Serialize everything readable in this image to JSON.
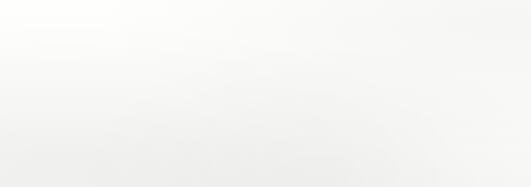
{
  "chart_data": {
    "type": "bar",
    "orientation": "horizontal",
    "title": "",
    "subtitle": "",
    "xlabel": "",
    "ylabel": "",
    "grid": false,
    "legend": null,
    "axis_line": "left vertical category axis",
    "xlim": [
      0,
      70
    ],
    "categories": [
      "1960",
      "1965",
      "1970",
      "1975",
      "1980",
      "1985",
      "1990",
      "1996"
    ],
    "values": [
      19,
      29,
      30,
      37,
      45,
      53,
      59,
      63
    ],
    "value_labels": [
      "19%",
      "29%",
      "30%",
      "37%",
      "45%",
      "53%",
      "59%",
      "63%"
    ],
    "tick_labels": [
      "1960",
      "1965",
      "1970",
      "1975",
      "1980",
      "1985",
      "1990",
      "1996"
    ],
    "annotations": [],
    "bar_colors": [
      "#575757",
      "#a9a9a9",
      "#575757",
      "#a9a9a9",
      "#575757",
      "#a9a9a9",
      "#575757",
      "#a9a9a9"
    ],
    "colors": {
      "bar_dark": "#575757",
      "bar_light": "#a9a9a9",
      "bar_dark_border": "#3e3e3e",
      "bar_light_border": "#7f7f7f",
      "axis": "#8d8d8d",
      "label_text": "#2a2a2a",
      "value_text": "#1b1b1b",
      "background": "#fdfdfc"
    },
    "bars": [
      {
        "category": "1960",
        "value": 19,
        "label": "19%",
        "shade": "dark",
        "top": 4,
        "height": 19,
        "width": 140,
        "label_x": 192
      },
      {
        "category": "1965",
        "value": 29,
        "label": "29%",
        "shade": "light",
        "top": 26,
        "height": 19,
        "width": 207,
        "label_x": 259
      },
      {
        "category": "1970",
        "value": 30,
        "label": "30%",
        "shade": "dark",
        "top": 48,
        "height": 19,
        "width": 213,
        "label_x": 265
      },
      {
        "category": "1975",
        "value": 37,
        "label": "37%",
        "shade": "light",
        "top": 70,
        "height": 19,
        "width": 261,
        "label_x": 313
      },
      {
        "category": "1980",
        "value": 45,
        "label": "45%",
        "shade": "dark",
        "top": 92,
        "height": 19,
        "width": 313,
        "label_x": 365
      },
      {
        "category": "1985",
        "value": 53,
        "label": "53%",
        "shade": "light",
        "top": 114,
        "height": 19,
        "width": 367,
        "label_x": 419
      },
      {
        "category": "1990",
        "value": 59,
        "label": "59%",
        "shade": "dark",
        "top": 136,
        "height": 19,
        "width": 407,
        "label_x": 459
      },
      {
        "category": "1996",
        "value": 63,
        "label": "63%",
        "shade": "light",
        "top": 158,
        "height": 19,
        "width": 438,
        "label_x": 490
      }
    ]
  }
}
